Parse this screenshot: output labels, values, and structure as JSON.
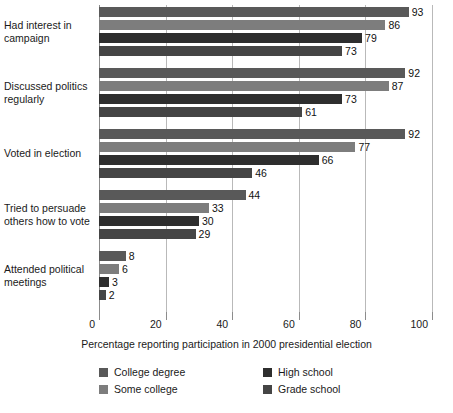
{
  "chart_data": {
    "type": "bar",
    "orientation": "horizontal",
    "title": "",
    "xlabel": "Percentage reporting participation in 2000 presidential election",
    "ylabel": "",
    "xlim": [
      0,
      100
    ],
    "xticks": [
      0,
      20,
      40,
      60,
      80,
      100
    ],
    "xtick_labels": [
      "0",
      "20",
      "40",
      "60",
      "80",
      "100"
    ],
    "grid": true,
    "grid_axis": "x",
    "legend_position": "bottom",
    "categories": [
      "Had interest in campaign",
      "Discussed politics regularly",
      "Voted in election",
      "Tried to persuade others how to vote",
      "Attended political meetings"
    ],
    "category_label_lines": [
      [
        "Had interest in",
        "campaign"
      ],
      [
        "Discussed politics",
        "regularly"
      ],
      [
        "Voted in election"
      ],
      [
        "Tried to persuade",
        "others how to vote"
      ],
      [
        "Attended political",
        "meetings"
      ]
    ],
    "series": [
      {
        "name": "College degree",
        "color": "#595959",
        "values": [
          93,
          92,
          92,
          44,
          8
        ],
        "value_labels": [
          "93",
          "92",
          "92",
          "44",
          "8"
        ]
      },
      {
        "name": "Some college",
        "color": "#7d7d7d",
        "values": [
          86,
          87,
          77,
          33,
          6
        ],
        "value_labels": [
          "86",
          "87",
          "77",
          "33",
          "6"
        ]
      },
      {
        "name": "High school",
        "color": "#2e2e2e",
        "values": [
          79,
          73,
          66,
          30,
          3
        ],
        "value_labels": [
          "79",
          "73",
          "66",
          "30",
          "3"
        ]
      },
      {
        "name": "Grade school",
        "color": "#454545",
        "values": [
          73,
          61,
          46,
          29,
          2
        ],
        "value_labels": [
          "73",
          "61",
          "46",
          "29",
          "2"
        ]
      }
    ]
  },
  "legend": {
    "columns": [
      [
        {
          "label": "College degree",
          "color": "#595959"
        },
        {
          "label": "Some college",
          "color": "#7d7d7d"
        }
      ],
      [
        {
          "label": "High school",
          "color": "#2e2e2e"
        },
        {
          "label": "Grade school",
          "color": "#454545"
        }
      ]
    ]
  },
  "colors": {
    "background": "#ffffff",
    "gridline": "#b9b9b9",
    "axis": "#8c8c8c",
    "text": "#1a1a1a"
  }
}
